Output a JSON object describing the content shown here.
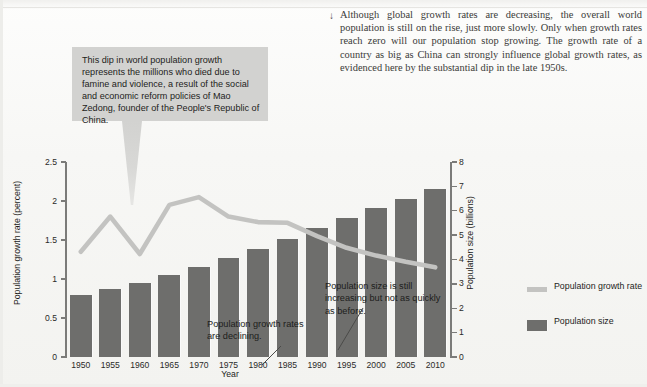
{
  "body": {
    "arrow_glyph": "↓",
    "paragraph": "Although global growth rates are decreasing, the overall world population is still on the rise, just more slowly. Only when growth rates reach zero will our population stop growing. The growth rate of a country as big as China can strongly influence global growth rates, as evidenced here by the substantial dip in the late 1950s."
  },
  "callout": {
    "text": "This dip in world population growth represents the millions who died due to famine and violence, a result of the social and economic reform policies of Mao Zedong, founder of the People's Republic of China."
  },
  "annotations": {
    "growth_declining": "Population growth rates are declining.",
    "size_increasing": "Population size is still increasing but not as quickly as before."
  },
  "legend": {
    "items": [
      {
        "label": "Population growth rate",
        "type": "line",
        "color": "#c3c3c1"
      },
      {
        "label": "Population size",
        "type": "bar",
        "color": "#6e6e6c"
      }
    ]
  },
  "chart_data": {
    "type": "bar",
    "title": "",
    "xlabel": "Year",
    "ylabel": "Population growth rate (percent)",
    "y2label": "Population size (billions)",
    "grid": false,
    "legend_position": "right",
    "categories": [
      "1950",
      "1955",
      "1960",
      "1965",
      "1970",
      "1975",
      "1980",
      "1985",
      "1990",
      "1995",
      "2000",
      "2005",
      "2010"
    ],
    "ylim": [
      0,
      2.5
    ],
    "yticks": [
      "0",
      "0.5",
      "1",
      "1.5",
      "2",
      "2.5"
    ],
    "y2lim": [
      0,
      8
    ],
    "y2ticks": [
      "0",
      "1",
      "2",
      "3",
      "4",
      "5",
      "6",
      "7",
      "8"
    ],
    "series": [
      {
        "name": "Population size",
        "type": "bar",
        "axis": "right",
        "unit": "billions",
        "color": "#6e6e6c",
        "values": [
          2.55,
          2.8,
          3.05,
          3.35,
          3.7,
          4.05,
          4.45,
          4.85,
          5.3,
          5.7,
          6.1,
          6.5,
          6.9
        ]
      },
      {
        "name": "Population growth rate",
        "type": "line",
        "axis": "left",
        "unit": "percent",
        "color": "#c3c3c1",
        "values": [
          1.35,
          1.8,
          1.32,
          1.95,
          2.05,
          1.8,
          1.73,
          1.72,
          1.55,
          1.4,
          1.3,
          1.22,
          1.15
        ]
      }
    ]
  }
}
